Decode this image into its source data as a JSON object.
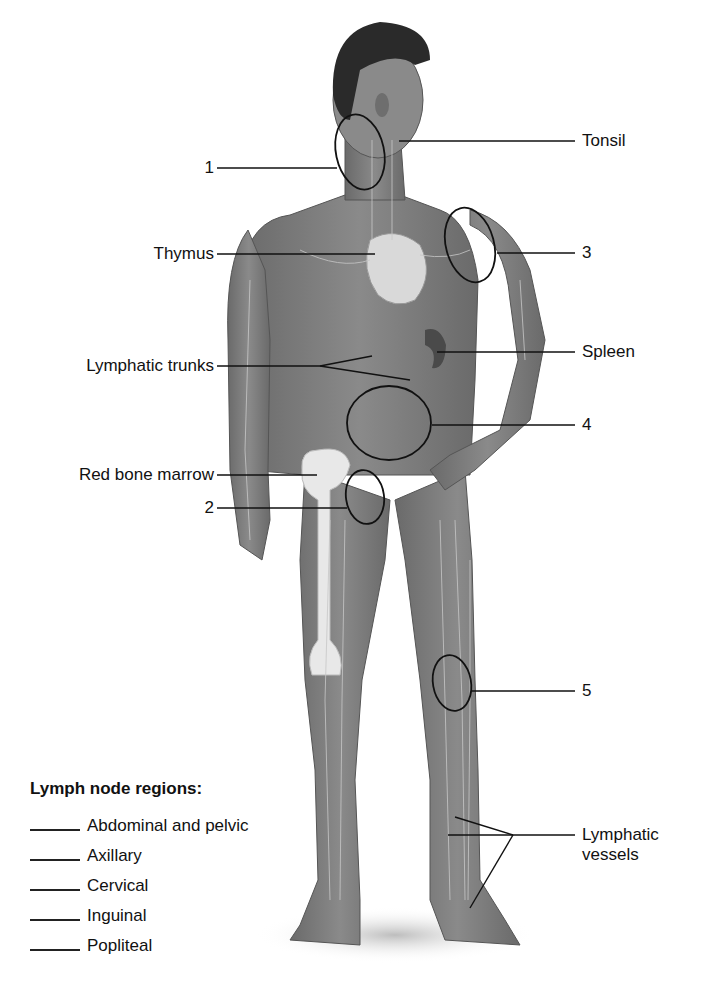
{
  "diagram": {
    "labels_left": [
      {
        "id": "1",
        "text": "1"
      },
      {
        "id": "thymus",
        "text": "Thymus"
      },
      {
        "id": "lymphatic-trunks",
        "text": "Lymphatic trunks"
      },
      {
        "id": "red-bone-marrow",
        "text": "Red bone marrow"
      },
      {
        "id": "2",
        "text": "2"
      }
    ],
    "labels_right": [
      {
        "id": "tonsil",
        "text": "Tonsil"
      },
      {
        "id": "3",
        "text": "3"
      },
      {
        "id": "spleen",
        "text": "Spleen"
      },
      {
        "id": "4",
        "text": "4"
      },
      {
        "id": "5",
        "text": "5"
      },
      {
        "id": "lymphatic-vessels",
        "text": "Lymphatic vessels"
      }
    ],
    "lymphatic_vessels_line1": "Lymphatic",
    "lymphatic_vessels_line2": "vessels"
  },
  "legend": {
    "title": "Lymph node regions:",
    "items": [
      {
        "label": "Abdominal and pelvic",
        "answer": ""
      },
      {
        "label": "Axillary",
        "answer": ""
      },
      {
        "label": "Cervical",
        "answer": ""
      },
      {
        "label": "Inguinal",
        "answer": ""
      },
      {
        "label": "Popliteal",
        "answer": ""
      }
    ]
  },
  "colors": {
    "background": "#ffffff",
    "skin": "#7a7a7a",
    "skin_dark": "#5a5a5a",
    "hair": "#2a2a2a",
    "bone": "#e6e6e6",
    "vessel": "#c8c8c8",
    "line": "#111111"
  }
}
